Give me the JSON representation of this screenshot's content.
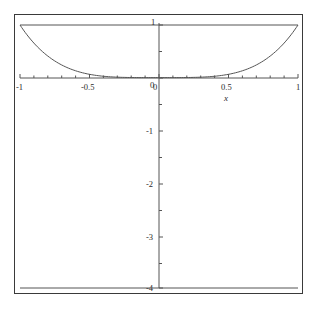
{
  "chart_data": {
    "type": "line",
    "title": "",
    "subtitle": "",
    "xlabel": "x",
    "ylabel": "",
    "xlim": [
      -1,
      1
    ],
    "ylim": [
      -4,
      1
    ],
    "grid": false,
    "legend": false,
    "legend_position": "none",
    "x_ticks": [
      -1,
      -0.5,
      0,
      0.5,
      1
    ],
    "x_tick_labels": [
      "-1",
      "-0.5",
      "0",
      "0.5",
      "1"
    ],
    "x_minor_tick_step": 0.1,
    "y_ticks": [
      1,
      0,
      -1,
      -2,
      -3,
      -4
    ],
    "y_tick_labels": [
      "1",
      "0",
      "-1",
      "-2",
      "-3",
      "-4"
    ],
    "y_minor_tick_step": 0.5,
    "series": [
      {
        "name": "curve",
        "kind": "curve",
        "color": "#555555",
        "x": [
          -1,
          -0.9,
          -0.8,
          -0.7,
          -0.6,
          -0.5,
          -0.4,
          -0.3,
          -0.2,
          -0.1,
          0,
          0.1,
          0.2,
          0.3,
          0.4,
          0.5,
          0.6,
          0.7,
          0.8,
          0.9,
          1
        ],
        "values": [
          1,
          0.6561,
          0.4096,
          0.2401,
          0.1296,
          0.0625,
          0.0256,
          0.0081,
          0.0016,
          0.0001,
          0,
          0.0001,
          0.0016,
          0.0081,
          0.0256,
          0.0625,
          0.1296,
          0.2401,
          0.4096,
          0.6561,
          1
        ]
      },
      {
        "name": "upper-horizontal-line",
        "kind": "horizontal",
        "color": "#555555",
        "y": 1
      },
      {
        "name": "lower-horizontal-line",
        "kind": "horizontal",
        "color": "#555555",
        "y": -4
      }
    ],
    "axis_labels": {
      "x_axis_name": "x"
    }
  },
  "colors": {
    "frame": "#3a3a3a",
    "axis": "#555555",
    "curve": "#555555",
    "text": "#2b2b2b",
    "background": "#ffffff"
  }
}
